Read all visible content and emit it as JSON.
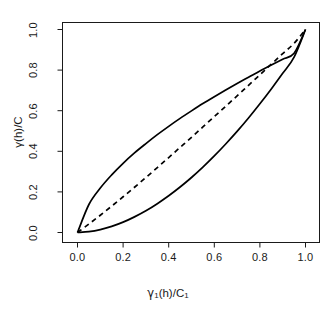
{
  "chart_data": {
    "type": "line",
    "title": "",
    "xlabel": "γ₁(h)/C₁",
    "ylabel": "γ(h)/C",
    "xlim": [
      0,
      1
    ],
    "ylim": [
      0,
      1
    ],
    "grid": false,
    "legend": "none",
    "xticks": [
      "0.0",
      "0.2",
      "0.4",
      "0.6",
      "0.8",
      "1.0"
    ],
    "xtick_values": [
      0,
      0.2,
      0.4,
      0.6,
      0.8,
      1.0
    ],
    "yticks": [
      "0.0",
      "0.2",
      "0.4",
      "0.6",
      "0.8",
      "1.0"
    ],
    "ytick_values": [
      0,
      0.2,
      0.4,
      0.6,
      0.8,
      1.0
    ],
    "x": [
      0,
      0.05,
      0.1,
      0.15,
      0.2,
      0.25,
      0.3,
      0.35,
      0.4,
      0.45,
      0.5,
      0.55,
      0.6,
      0.65,
      0.7,
      0.75,
      0.8,
      0.85,
      0.9,
      0.95,
      1.0
    ],
    "series": [
      {
        "name": "upper-bound",
        "style": "solid",
        "color": "#000000",
        "values": [
          0,
          0.138,
          0.219,
          0.284,
          0.341,
          0.392,
          0.438,
          0.482,
          0.523,
          0.562,
          0.599,
          0.635,
          0.669,
          0.702,
          0.734,
          0.765,
          0.796,
          0.825,
          0.854,
          0.883,
          1.0
        ]
      },
      {
        "name": "middle-reference",
        "style": "dashed",
        "color": "#000000",
        "values": [
          0,
          0.042,
          0.085,
          0.13,
          0.176,
          0.223,
          0.271,
          0.32,
          0.369,
          0.419,
          0.469,
          0.52,
          0.571,
          0.622,
          0.673,
          0.725,
          0.777,
          0.829,
          0.881,
          0.932,
          1.0
        ]
      },
      {
        "name": "lower-bound",
        "style": "solid",
        "color": "#000000",
        "values": [
          0,
          0.004,
          0.014,
          0.03,
          0.051,
          0.077,
          0.107,
          0.142,
          0.181,
          0.224,
          0.271,
          0.322,
          0.377,
          0.436,
          0.498,
          0.564,
          0.634,
          0.707,
          0.784,
          0.864,
          1.0
        ]
      }
    ]
  },
  "axes": {
    "x_title": "γ₁(h)/C₁",
    "y_title": "γ(h)/C",
    "x_title_base": "γ",
    "x_title_sub1": "1",
    "x_title_mid": "(h)/C",
    "x_title_sub2": "1",
    "y_title_text": "γ(h)/C"
  }
}
